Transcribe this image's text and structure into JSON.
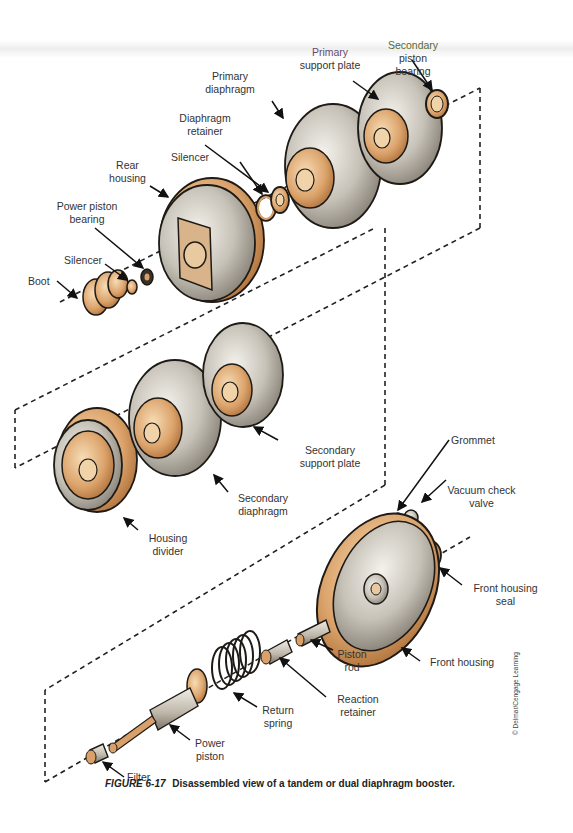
{
  "figure": {
    "number": "FIGURE 6-17",
    "caption": "Disassembled view of a tandem or dual diaphragm booster.",
    "credit": "© Delmar/Cengage Learning"
  },
  "labels": {
    "secondary_piston_bearing": [
      "Secondary",
      "piston",
      "bearing"
    ],
    "primary_support_plate": [
      "Primary",
      "support plate"
    ],
    "primary_diaphragm": [
      "Primary",
      "diaphragm"
    ],
    "diaphragm_retainer": [
      "Diaphragm",
      "retainer"
    ],
    "silencer_upper": "Silencer",
    "rear_housing": [
      "Rear",
      "housing"
    ],
    "power_piston_bearing": [
      "Power piston",
      "bearing"
    ],
    "silencer_lower": "Silencer",
    "boot": "Boot",
    "secondary_support_plate": [
      "Secondary",
      "support plate"
    ],
    "secondary_diaphragm": [
      "Secondary",
      "diaphragm"
    ],
    "housing_divider": [
      "Housing",
      "divider"
    ],
    "grommet": "Grommet",
    "vacuum_check_valve": [
      "Vacuum check",
      "valve"
    ],
    "front_housing_seal": [
      "Front housing",
      "seal"
    ],
    "front_housing": "Front housing",
    "piston_rod": [
      "Piston",
      "rod"
    ],
    "reaction_retainer": [
      "Reaction",
      "retainer"
    ],
    "return_spring": [
      "Return",
      "spring"
    ],
    "power_piston": [
      "Power",
      "piston"
    ],
    "filter": "Filter"
  },
  "colors": {
    "metal_light": "#e8e6e0",
    "metal_dark": "#8a8478",
    "copper": "#d9a06a",
    "copper_light": "#f1d3aa",
    "outline": "#1e1a16",
    "label_text": "#333333"
  }
}
